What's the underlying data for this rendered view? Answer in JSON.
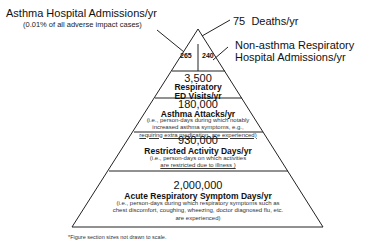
{
  "callouts": {
    "asthma_hospital": {
      "label": "Asthma Hospital Admissions/yr",
      "sublabel": "(0.01% of all adverse impact cases)",
      "value": "265"
    },
    "deaths": {
      "value": "75",
      "label": "Deaths/yr"
    },
    "non_asthma_hospital": {
      "label_line1": "Non-asthma Respiratory",
      "label_line2": "Hospital Admissions/yr",
      "value": "240"
    }
  },
  "tiers": [
    {
      "value": "3,500",
      "title_line1": "Respiratory",
      "title_line2": "ED Visits/yr"
    },
    {
      "value": "180,000",
      "title": "Asthma Attacks/yr",
      "desc_line1": "(i.e., person-days during which notably",
      "desc_line2": "increased asthma symptoms, e.g.,",
      "desc_line3": "requiring extra medication, are experienced)"
    },
    {
      "value": "930,000",
      "title": "Restricted Activity Days/yr",
      "desc_line1": "(i.e., person-days on which activities",
      "desc_line2": "are restricted due to illness )"
    },
    {
      "value": "2,000,000",
      "title": "Acute Respiratory Symptom Days/yr",
      "desc_line1": "(i.e., person-days during which respiratory symptoms such as",
      "desc_line2": "chest discomfort, coughing, wheezing, doctor diagnosed flu, etc.",
      "desc_line3": "are experienced)"
    }
  ],
  "footnote": "*Figure section sizes not drawn to scale.",
  "colors": {
    "line": "#222222",
    "background": "#ffffff"
  }
}
